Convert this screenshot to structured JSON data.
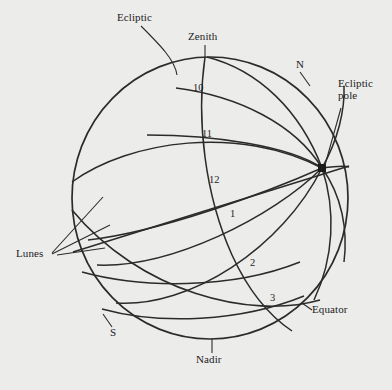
{
  "figure": {
    "type": "celestial-sphere-diagram",
    "background_color": "#ececeb",
    "ink_color": "#2b2b2b",
    "sphere": {
      "center_x": 210,
      "center_y": 198,
      "radius_x": 138,
      "radius_y": 141
    }
  },
  "labels": {
    "ecliptic": "Ecliptic",
    "zenith": "Zenith",
    "north": "N",
    "ecliptic_pole_line1": "Ecliptic",
    "ecliptic_pole_line2": "pole",
    "lunes": "Lunes",
    "south": "S",
    "equator": "Equator",
    "nadir": "Nadir"
  },
  "lune_numbers": [
    {
      "label": "10",
      "x": 193,
      "y": 82
    },
    {
      "label": "11",
      "x": 202,
      "y": 128
    },
    {
      "label": "12",
      "x": 209,
      "y": 174
    },
    {
      "label": "1",
      "x": 230,
      "y": 208
    },
    {
      "label": "2",
      "x": 250,
      "y": 257
    },
    {
      "label": "3",
      "x": 270,
      "y": 292
    }
  ],
  "nodes": {
    "ecliptic_pole": {
      "x": 322,
      "y": 168
    }
  }
}
